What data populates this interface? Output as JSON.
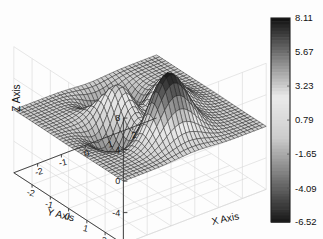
{
  "figure": {
    "background_color": "#fdfdfd",
    "width": 323,
    "height": 239
  },
  "chart_data": {
    "type": "surface",
    "title": "",
    "function": "peaks",
    "formula": "z = 3*(1-x)^2*exp(-x^2-(y+1)^2) - 10*(x/5 - x^3 - y^5)*exp(-x^2-y^2) - (1/3)*exp(-(x+1)^2-y^2)",
    "xlabel": "X Axis",
    "ylabel": "Y Axis",
    "zlabel": "Z Axis",
    "xlim": [
      -3,
      3
    ],
    "ylim": [
      -3,
      3
    ],
    "zlim": [
      -8,
      8
    ],
    "xticks": [
      -2,
      -1,
      0,
      1,
      2
    ],
    "xticklabels": [
      "-2",
      "-1",
      "0",
      "1",
      "2"
    ],
    "yticks": [
      2,
      1,
      0,
      -1,
      -2
    ],
    "yticklabels": [
      "2",
      "1",
      "0",
      "-1",
      "-2"
    ],
    "zticks": [
      8,
      4,
      0,
      -4,
      -8
    ],
    "zticklabels": [
      "8",
      "4",
      "0",
      "-4",
      "-8"
    ],
    "grid": true,
    "mesh": true,
    "colormap": "gray",
    "shading": "faceted",
    "view_azimuth": -37.5,
    "view_elevation": 30,
    "zmin_data": -6.52,
    "zmax_data": 8.11,
    "grid_steps": 36
  },
  "colorbar": {
    "orientation": "vertical",
    "position": "right",
    "ticks": [
      8.11,
      5.67,
      3.23,
      0.79,
      -1.65,
      -4.09,
      -6.52
    ],
    "ticklabels": [
      "8.11",
      "5.67",
      "3.23",
      "0.79",
      "-1.65",
      "-4.09",
      "-6.52"
    ],
    "vmin": -6.52,
    "vmax": 8.11,
    "border_color": "#202020",
    "band_count": 64
  },
  "colors": {
    "text": "#111111",
    "axis_line": "#333333",
    "grid_line": "#d6d6d6",
    "mesh_line": "#1c1c1c",
    "surface_light": "#f2f2f2",
    "surface_dark": "#141414"
  }
}
